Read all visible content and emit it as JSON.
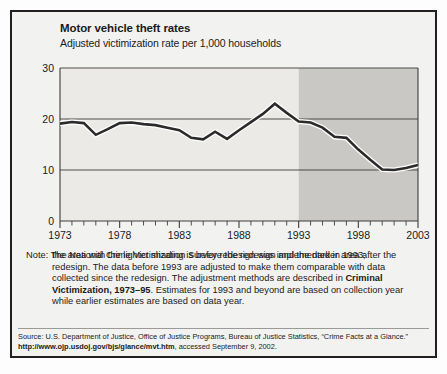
{
  "figure": {
    "title": "Motor vehicle theft rates",
    "subtitle": "Adjusted victimization rate per 1,000 households"
  },
  "note": {
    "label": "Note:",
    "line1": "The National Crime Victimization Survey redesign was implemented in 1993;",
    "line2": "the area with the lighter shading is before the redesign and the darker area",
    "line3": "after the redesign. The data before 1993 are adjusted to make them comparable",
    "line4_pre": "with data collected since the redesign. The adjustment methods are described",
    "line5_pre": "in ",
    "line5_bold": "Criminal Victimization, 1973–95",
    "line5_post": ". Estimates for 1993 and beyond are based",
    "line6": "on collection year while earlier estimates are based on data year."
  },
  "source": {
    "line1": "Source: U.S. Department of Justice, Office of Justice Programs, Bureau of Justice Statistics, “Crime Facts at a Glance.”",
    "url": "http://www.ojp.usdoj.gov/bjs/glance/mvt.htm",
    "accessed": ", accessed September 9, 2002."
  },
  "colors": {
    "frame": "#231f20",
    "plot_background_light": "#eceae7",
    "plot_background_dark": "#c9c8c4",
    "gridline": "#3c3c3c",
    "line": "#2b2b2b",
    "text": "#1b1b1b"
  },
  "chart_data": {
    "type": "line",
    "title": "Motor vehicle theft rates",
    "subtitle": "Adjusted victimization rate per 1,000 households",
    "xlabel": "",
    "ylabel": "Adjusted victimization rate per 1,000 households",
    "xlim": [
      1973,
      2003
    ],
    "ylim": [
      0,
      30
    ],
    "yticks": [
      0,
      10,
      20,
      30
    ],
    "ytick_labels": [
      "0",
      "10",
      "20",
      "30"
    ],
    "xticks": [
      1973,
      1974,
      1975,
      1976,
      1977,
      1978,
      1979,
      1980,
      1981,
      1982,
      1983,
      1984,
      1985,
      1986,
      1987,
      1988,
      1989,
      1990,
      1991,
      1992,
      1993,
      1994,
      1995,
      1996,
      1997,
      1998,
      1999,
      2000,
      2001,
      2002,
      2003
    ],
    "xtick_labels_shown": [
      "1973",
      "1978",
      "1983",
      "1988",
      "1993",
      "1998",
      "2003"
    ],
    "grid": "horizontal",
    "legend": "none",
    "shaded_regions": [
      {
        "name": "before-redesign",
        "from": 1973,
        "to": 1993,
        "color": "#eceae7"
      },
      {
        "name": "after-redesign",
        "from": 1993,
        "to": 2003,
        "color": "#c9c8c4"
      }
    ],
    "series": [
      {
        "name": "Motor vehicle theft rate",
        "x": [
          1973,
          1974,
          1975,
          1976,
          1977,
          1978,
          1979,
          1980,
          1981,
          1982,
          1983,
          1984,
          1985,
          1986,
          1987,
          1988,
          1989,
          1990,
          1991,
          1992,
          1993,
          1994,
          1995,
          1996,
          1997,
          1998,
          1999,
          2000,
          2001,
          2002,
          2003
        ],
        "values": [
          19.1,
          19.4,
          19.2,
          16.9,
          18.0,
          19.2,
          19.3,
          19.0,
          18.8,
          18.3,
          17.8,
          16.3,
          16.0,
          17.5,
          16.1,
          17.8,
          19.4,
          21.0,
          23.0,
          21.2,
          19.5,
          19.3,
          18.3,
          16.5,
          16.3,
          14.0,
          12.0,
          10.1,
          10.0,
          10.4,
          11.0
        ]
      }
    ]
  }
}
